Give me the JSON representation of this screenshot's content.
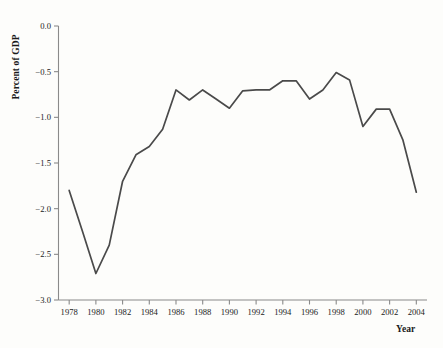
{
  "chart_data": {
    "type": "line",
    "title": "",
    "xlabel": "Year",
    "ylabel": "Percent of GDP",
    "xlim": [
      1977.2,
      2004.8
    ],
    "ylim": [
      -3.0,
      0.0
    ],
    "grid": false,
    "legend": null,
    "x_ticks": [
      1978,
      1980,
      1982,
      1984,
      1986,
      1988,
      1990,
      1992,
      1994,
      1996,
      1998,
      2000,
      2002,
      2004
    ],
    "x_tick_labels": [
      "1978",
      "1980",
      "1982",
      "1984",
      "1986",
      "1988",
      "1990",
      "1992",
      "1994",
      "1996",
      "1998",
      "2000",
      "2002",
      "2004"
    ],
    "y_ticks": [
      0.0,
      -0.5,
      -1.0,
      -1.5,
      -2.0,
      -2.5,
      -3.0
    ],
    "y_tick_labels": [
      "0.0",
      "-0.5",
      "-1.0",
      "-1.5",
      "-2.0",
      "-2.5",
      "-3.0"
    ],
    "line_color": "#4a4a4a",
    "line_width": 1.7,
    "axis_color": "#8a8a8a",
    "background_color": "#fdfdfb",
    "series": [
      {
        "name": "Percent of GDP",
        "x": [
          1978,
          1979,
          1980,
          1981,
          1982,
          1983,
          1984,
          1985,
          1986,
          1987,
          1988,
          1989,
          1990,
          1991,
          1992,
          1993,
          1994,
          1995,
          1996,
          1997,
          1998,
          1999,
          2000,
          2001,
          2002,
          2003,
          2004
        ],
        "values": [
          -1.8,
          -2.25,
          -2.71,
          -2.4,
          -1.7,
          -1.41,
          -1.32,
          -1.13,
          -0.7,
          -0.81,
          -0.7,
          -0.8,
          -0.9,
          -0.71,
          -0.7,
          -0.7,
          -0.6,
          -0.6,
          -0.8,
          -0.7,
          -0.51,
          -0.59,
          -1.1,
          -0.91,
          -0.91,
          -1.25,
          -1.82
        ]
      }
    ]
  }
}
